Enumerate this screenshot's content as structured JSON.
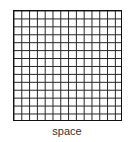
{
  "diagram": {
    "grid": {
      "columns": 14,
      "rows": 14,
      "line_color": "#222222"
    },
    "label": "space"
  }
}
